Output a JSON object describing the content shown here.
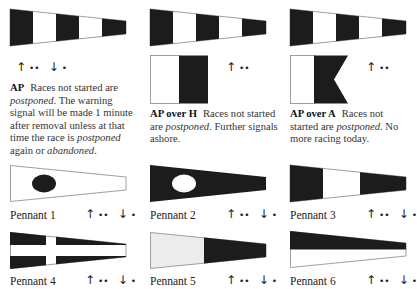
{
  "colors": {
    "dark": "#1c1c1c",
    "light": "#ffffff",
    "pennant5_light": "#ececec",
    "outline": "#888888"
  },
  "indicators": {
    "up_arrow": "↑",
    "down_arrow": "↓",
    "two_sounds": "••",
    "one_sound": "•"
  },
  "signals": [
    {
      "id": "AP",
      "code": "AP",
      "flags": [
        "AP pennant"
      ],
      "up_sounds": "••",
      "down_sounds": "•",
      "text_parts": [
        {
          "t": "Races not started are ",
          "i": false
        },
        {
          "t": "postponed",
          "i": true
        },
        {
          "t": ". The warning signal will be made 1 minute after removal unless at that time the race is ",
          "i": false
        },
        {
          "t": "postponed",
          "i": true
        },
        {
          "t": " again or ",
          "i": false
        },
        {
          "t": "abandoned",
          "i": true
        },
        {
          "t": ".",
          "i": false
        }
      ]
    },
    {
      "id": "AP-over-H",
      "code": "AP over H",
      "flags": [
        "AP pennant",
        "H flag"
      ],
      "up_sounds": "••",
      "text_parts": [
        {
          "t": "Races not started are ",
          "i": false
        },
        {
          "t": "postponed",
          "i": true
        },
        {
          "t": ". Further signals ashore.",
          "i": false
        }
      ]
    },
    {
      "id": "AP-over-A",
      "code": "AP over A",
      "flags": [
        "AP pennant",
        "A flag"
      ],
      "up_sounds": "••",
      "text_parts": [
        {
          "t": "Races not started are ",
          "i": false
        },
        {
          "t": "postponed",
          "i": true
        },
        {
          "t": ". No more racing today.",
          "i": false
        }
      ]
    }
  ],
  "pennants": [
    {
      "label": "Pennant 1",
      "up_sounds": "••",
      "down_sounds": "•"
    },
    {
      "label": "Pennant 2",
      "up_sounds": "••",
      "down_sounds": "•"
    },
    {
      "label": "Pennant 3",
      "up_sounds": "••",
      "down_sounds": "•"
    },
    {
      "label": "Pennant 4",
      "up_sounds": "••",
      "down_sounds": "•"
    },
    {
      "label": "Pennant 5",
      "up_sounds": "••",
      "down_sounds": "•"
    },
    {
      "label": "Pennant 6",
      "up_sounds": "••",
      "down_sounds": "•"
    }
  ]
}
